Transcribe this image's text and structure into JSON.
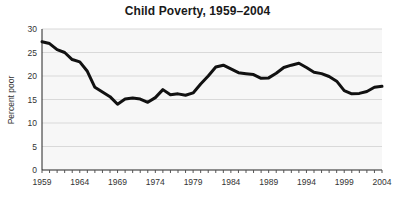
{
  "chart_data": {
    "type": "line",
    "title": "Child Poverty, 1959–2004",
    "xlabel": "",
    "ylabel": "Percent poor",
    "xlim": [
      1959,
      2004
    ],
    "ylim": [
      0,
      30
    ],
    "grid": true,
    "legend": "none",
    "y_ticks": [
      0,
      5,
      10,
      15,
      20,
      25,
      30
    ],
    "y_tick_labels": [
      "0",
      "5",
      "10",
      "15",
      "20",
      "25",
      "30"
    ],
    "x_tick_labels": [
      "1959",
      "1964",
      "1969",
      "1974",
      "1979",
      "1984",
      "1989",
      "1994",
      "1999",
      "2004"
    ],
    "x_tick_values": [
      1959,
      1964,
      1969,
      1974,
      1979,
      1984,
      1989,
      1994,
      1999,
      2004
    ],
    "x_minor_ticks_every": 1,
    "line_color": "#111111",
    "plot_background": "#f7f7f7",
    "gridline_color": "#d9d9d9",
    "series": [
      {
        "name": "Percent poor",
        "x": [
          1959,
          1960,
          1961,
          1962,
          1963,
          1964,
          1965,
          1966,
          1967,
          1968,
          1969,
          1970,
          1971,
          1972,
          1973,
          1974,
          1975,
          1976,
          1977,
          1978,
          1979,
          1980,
          1981,
          1982,
          1983,
          1984,
          1985,
          1986,
          1987,
          1988,
          1989,
          1990,
          1991,
          1992,
          1993,
          1994,
          1995,
          1996,
          1997,
          1998,
          1999,
          2000,
          2001,
          2002,
          2003,
          2004
        ],
        "values": [
          27.3,
          26.9,
          25.6,
          25.0,
          23.5,
          23.0,
          21.0,
          17.6,
          16.6,
          15.6,
          14.0,
          15.1,
          15.3,
          15.1,
          14.4,
          15.4,
          17.1,
          16.0,
          16.2,
          15.9,
          16.4,
          18.3,
          20.0,
          21.9,
          22.3,
          21.5,
          20.7,
          20.5,
          20.3,
          19.5,
          19.6,
          20.6,
          21.8,
          22.3,
          22.7,
          21.8,
          20.8,
          20.5,
          19.9,
          18.9,
          16.9,
          16.2,
          16.3,
          16.7,
          17.6,
          17.8
        ]
      }
    ]
  }
}
